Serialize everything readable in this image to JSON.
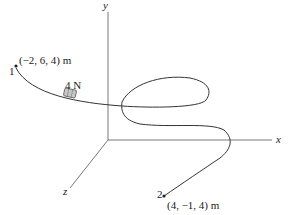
{
  "figure": {
    "axes": {
      "x_label": "x",
      "y_label": "y",
      "z_label": "z"
    },
    "points": [
      {
        "id": "1",
        "label": "1",
        "coords": "(−2, 6, 4) m"
      },
      {
        "id": "2",
        "label": "2",
        "coords": "(4, −1, 4) m"
      }
    ],
    "collar": {
      "force_label": "4 N"
    },
    "colors": {
      "line": "#333333",
      "axis": "#555555",
      "collar": "#aaaaaa"
    }
  }
}
